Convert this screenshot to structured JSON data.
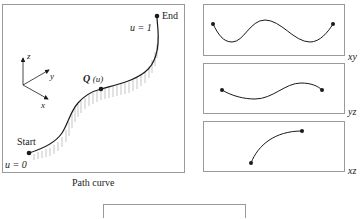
{
  "main_panel": {
    "caption": "Path curve",
    "start_label": "Start",
    "end_label": "End",
    "u_start": "u = 0",
    "u_end": "u = 1",
    "point_label_q": "Q",
    "point_label_u": "(u)",
    "axes": {
      "x": "x",
      "y": "y",
      "z": "z"
    }
  },
  "projections": [
    {
      "label": "xy"
    },
    {
      "label": "yz"
    },
    {
      "label": "xz"
    }
  ],
  "colors": {
    "border": "#9a9a9a",
    "curve": "#1a1a1a",
    "hatch": "#a0a0a0"
  }
}
